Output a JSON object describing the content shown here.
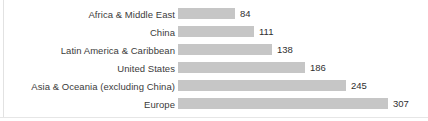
{
  "chart_data": {
    "type": "bar",
    "orientation": "horizontal",
    "title": "",
    "subtitle": "",
    "xlabel": "",
    "ylabel": "",
    "grid": false,
    "legend": false,
    "legend_position": "none",
    "axis_visible": false,
    "tick_labels_visible": false,
    "data_labels": true,
    "xlim": [
      0,
      307
    ],
    "categories": [
      "Africa & Middle East",
      "China",
      "Latin America & Caribbean",
      "United States",
      "Asia & Oceania (excluding China)",
      "Europe"
    ],
    "values": [
      84,
      111,
      138,
      186,
      245,
      307
    ],
    "value_labels": [
      "84",
      "111",
      "138",
      "186",
      "245",
      "307"
    ],
    "series": [
      {
        "name": "",
        "values": [
          84,
          111,
          138,
          186,
          245,
          307
        ]
      }
    ],
    "colors": {
      "bar_fill": "#c6c6c6",
      "label_text": "#3b3b3b",
      "value_text": "#2f2f2f",
      "background": "#ffffff",
      "rule": "#e2e2e2"
    }
  },
  "bars": [
    {
      "label": "Africa & Middle East",
      "value": 84,
      "value_label": "84"
    },
    {
      "label": "China",
      "value": 111,
      "value_label": "111"
    },
    {
      "label": "Latin America & Caribbean",
      "value": 138,
      "value_label": "138"
    },
    {
      "label": "United States",
      "value": 186,
      "value_label": "186"
    },
    {
      "label": "Asia & Oceania (excluding China)",
      "value": 245,
      "value_label": "245"
    },
    {
      "label": "Europe",
      "value": 307,
      "value_label": "307"
    }
  ]
}
